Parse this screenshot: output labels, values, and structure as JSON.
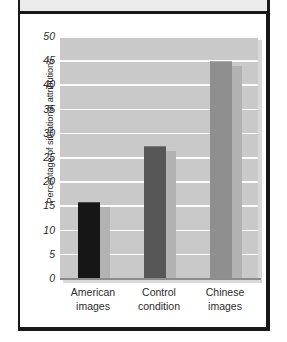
{
  "figure": {
    "frame_color": "#171717",
    "top_band_color": "#ebebeb"
  },
  "chart_data": {
    "type": "bar",
    "title": "",
    "subtitle": "",
    "xlabel": "",
    "ylabel": "Percentage of situational attributions",
    "categories": [
      "American images",
      "Control condition",
      "Chinese images"
    ],
    "category_lines": [
      [
        "American",
        "images"
      ],
      [
        "Control",
        "condition"
      ],
      [
        "Chinese",
        "images"
      ]
    ],
    "values": [
      15.8,
      27.2,
      44.9
    ],
    "ylim": [
      0,
      50
    ],
    "yticks": [
      0,
      5,
      10,
      15,
      20,
      25,
      30,
      35,
      40,
      45,
      50
    ],
    "ytick_labels": [
      "0",
      "5",
      "10",
      "15",
      "20",
      "25",
      "30",
      "35",
      "40",
      "45",
      "50"
    ],
    "grid": true,
    "gridline_color": "#fbfbfb",
    "plot_background": "#c9c9c9",
    "legend": null,
    "legend_position": "none",
    "bar_colors": [
      "#161616",
      "#575757",
      "#8f8f8f"
    ],
    "bar_shadow_color": "#b2b2b2",
    "annotations": []
  }
}
